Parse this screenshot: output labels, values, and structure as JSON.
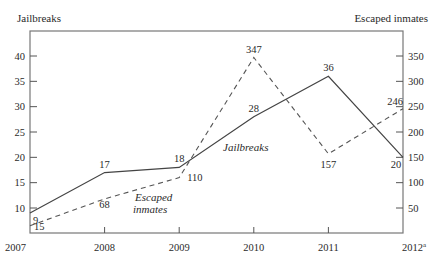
{
  "chart_data": {
    "type": "line",
    "title": "",
    "categories": [
      "2007",
      "2008",
      "2009",
      "2010",
      "2011",
      "2012"
    ],
    "category_superscripts": [
      "",
      "",
      "",
      "",
      "",
      "a"
    ],
    "series": [
      {
        "name": "Jailbreaks",
        "axis": "left",
        "style": "solid",
        "values": [
          9,
          17,
          18,
          28,
          36,
          20
        ]
      },
      {
        "name": "Escaped inmates",
        "axis": "right",
        "style": "dashed",
        "values": [
          15,
          68,
          110,
          347,
          157,
          246
        ]
      }
    ],
    "left_axis": {
      "label": "Jailbreaks",
      "ticks": [
        10,
        15,
        20,
        25,
        30,
        35,
        40
      ]
    },
    "right_axis": {
      "label": "Escaped inmates",
      "ticks": [
        50,
        100,
        150,
        200,
        250,
        300,
        350
      ]
    },
    "series_annotations": [
      {
        "text": "Jailbreaks",
        "series": "Jailbreaks"
      },
      {
        "text": "Escaped",
        "series": "Escaped inmates"
      },
      {
        "text": "inmates",
        "series": "Escaped inmates"
      }
    ],
    "grid": false,
    "legend": "inline labels"
  },
  "labels": {
    "left_axis_title": "Jailbreaks",
    "right_axis_title": "Escaped inmates"
  }
}
